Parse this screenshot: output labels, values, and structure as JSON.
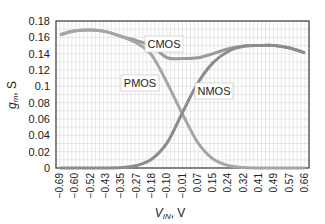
{
  "chart_data": {
    "type": "line",
    "title": "",
    "xlabel": "V_IN, V",
    "ylabel": "g_m, S",
    "ylim": [
      0,
      0.18
    ],
    "yticks": [
      "0",
      "0.02",
      "0.04",
      "0.06",
      "0.08",
      "0.1",
      "0.12",
      "0.14",
      "0.16",
      "0.18"
    ],
    "categories": [
      "-0.69",
      "-0.60",
      "-0.52",
      "-0.43",
      "-0.35",
      "-0.27",
      "-0.18",
      "-0.10",
      "-0.01",
      "0.07",
      "0.15",
      "0.24",
      "0.32",
      "0.41",
      "0.49",
      "0.57",
      "0.66"
    ],
    "grid": true,
    "legend": "inline labels",
    "series": [
      {
        "name": "PMOS",
        "values": [
          0.163,
          0.168,
          0.169,
          0.167,
          0.161,
          0.153,
          0.138,
          0.104,
          0.066,
          0.031,
          0.011,
          0.003,
          0.0005,
          0,
          0,
          0,
          0
        ]
      },
      {
        "name": "NMOS",
        "values": [
          0,
          0,
          0,
          0,
          0.0005,
          0.003,
          0.011,
          0.031,
          0.068,
          0.104,
          0.129,
          0.143,
          0.149,
          0.15,
          0.15,
          0.147,
          0.141
        ]
      },
      {
        "name": "CMOS",
        "values": [
          0.163,
          0.168,
          0.169,
          0.167,
          0.161,
          0.156,
          0.149,
          0.135,
          0.134,
          0.135,
          0.14,
          0.146,
          0.1495,
          0.15,
          0.15,
          0.147,
          0.141
        ]
      }
    ],
    "annotations": [
      {
        "text": "CMOS",
        "x": "-0.18",
        "y": 0.152
      },
      {
        "text": "PMOS",
        "x": "-0.18",
        "y": 0.115
      },
      {
        "text": "NMOS",
        "x": "0.15",
        "y": 0.096
      }
    ]
  }
}
